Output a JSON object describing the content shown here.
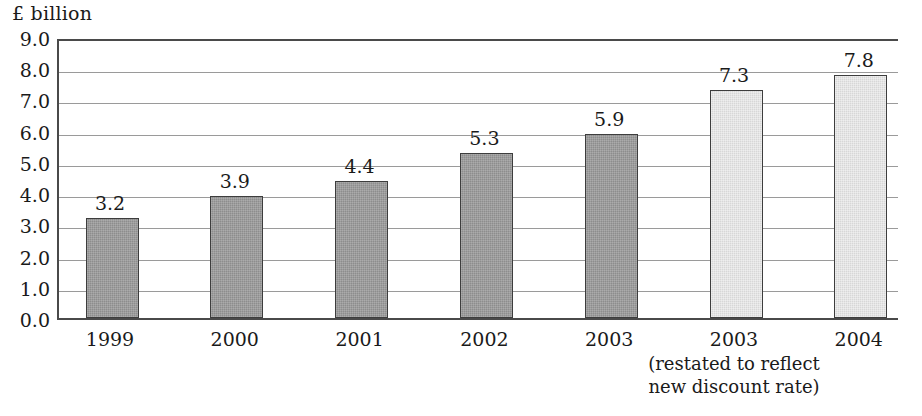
{
  "chart_data": {
    "type": "bar",
    "title": "",
    "xlabel": "",
    "ylabel": "£ billion",
    "unit_caption": "£ billion",
    "categories": [
      "1999",
      "2000",
      "2001",
      "2002",
      "2003",
      "2003",
      "2004"
    ],
    "values": [
      3.2,
      3.9,
      4.4,
      5.3,
      5.9,
      7.3,
      7.8
    ],
    "value_labels": [
      "3.2",
      "3.9",
      "4.4",
      "5.3",
      "5.9",
      "7.3",
      "7.8"
    ],
    "series": [
      {
        "name": "£ billion",
        "values": [
          3.2,
          3.9,
          4.4,
          5.3,
          5.9,
          7.3,
          7.8
        ]
      }
    ],
    "bar_tones": [
      "dark",
      "dark",
      "dark",
      "dark",
      "dark",
      "light",
      "light"
    ],
    "ylim": [
      0.0,
      9.0
    ],
    "ytick_step": 1.0,
    "ytick_labels": [
      "9.0",
      "8.0",
      "7.0",
      "6.0",
      "5.0",
      "4.0",
      "3.0",
      "2.0",
      "1.0",
      "0.0"
    ],
    "ytick_values": [
      9.0,
      8.0,
      7.0,
      6.0,
      5.0,
      4.0,
      3.0,
      2.0,
      1.0,
      0.0
    ],
    "grid": true,
    "legend": false,
    "annotations": [
      {
        "text": "(restated to reflect\nnew discount rate)",
        "attached_to_category_index": 5
      }
    ]
  },
  "colors": {
    "bar_dark": "#8d8d8d",
    "bar_light": "#d7d7d7",
    "bar_outline": "#3d3d3d",
    "gridline": "#9a9a9a",
    "axis": "#4a4a4a",
    "text": "#1a1a1a",
    "background": "#ffffff"
  }
}
